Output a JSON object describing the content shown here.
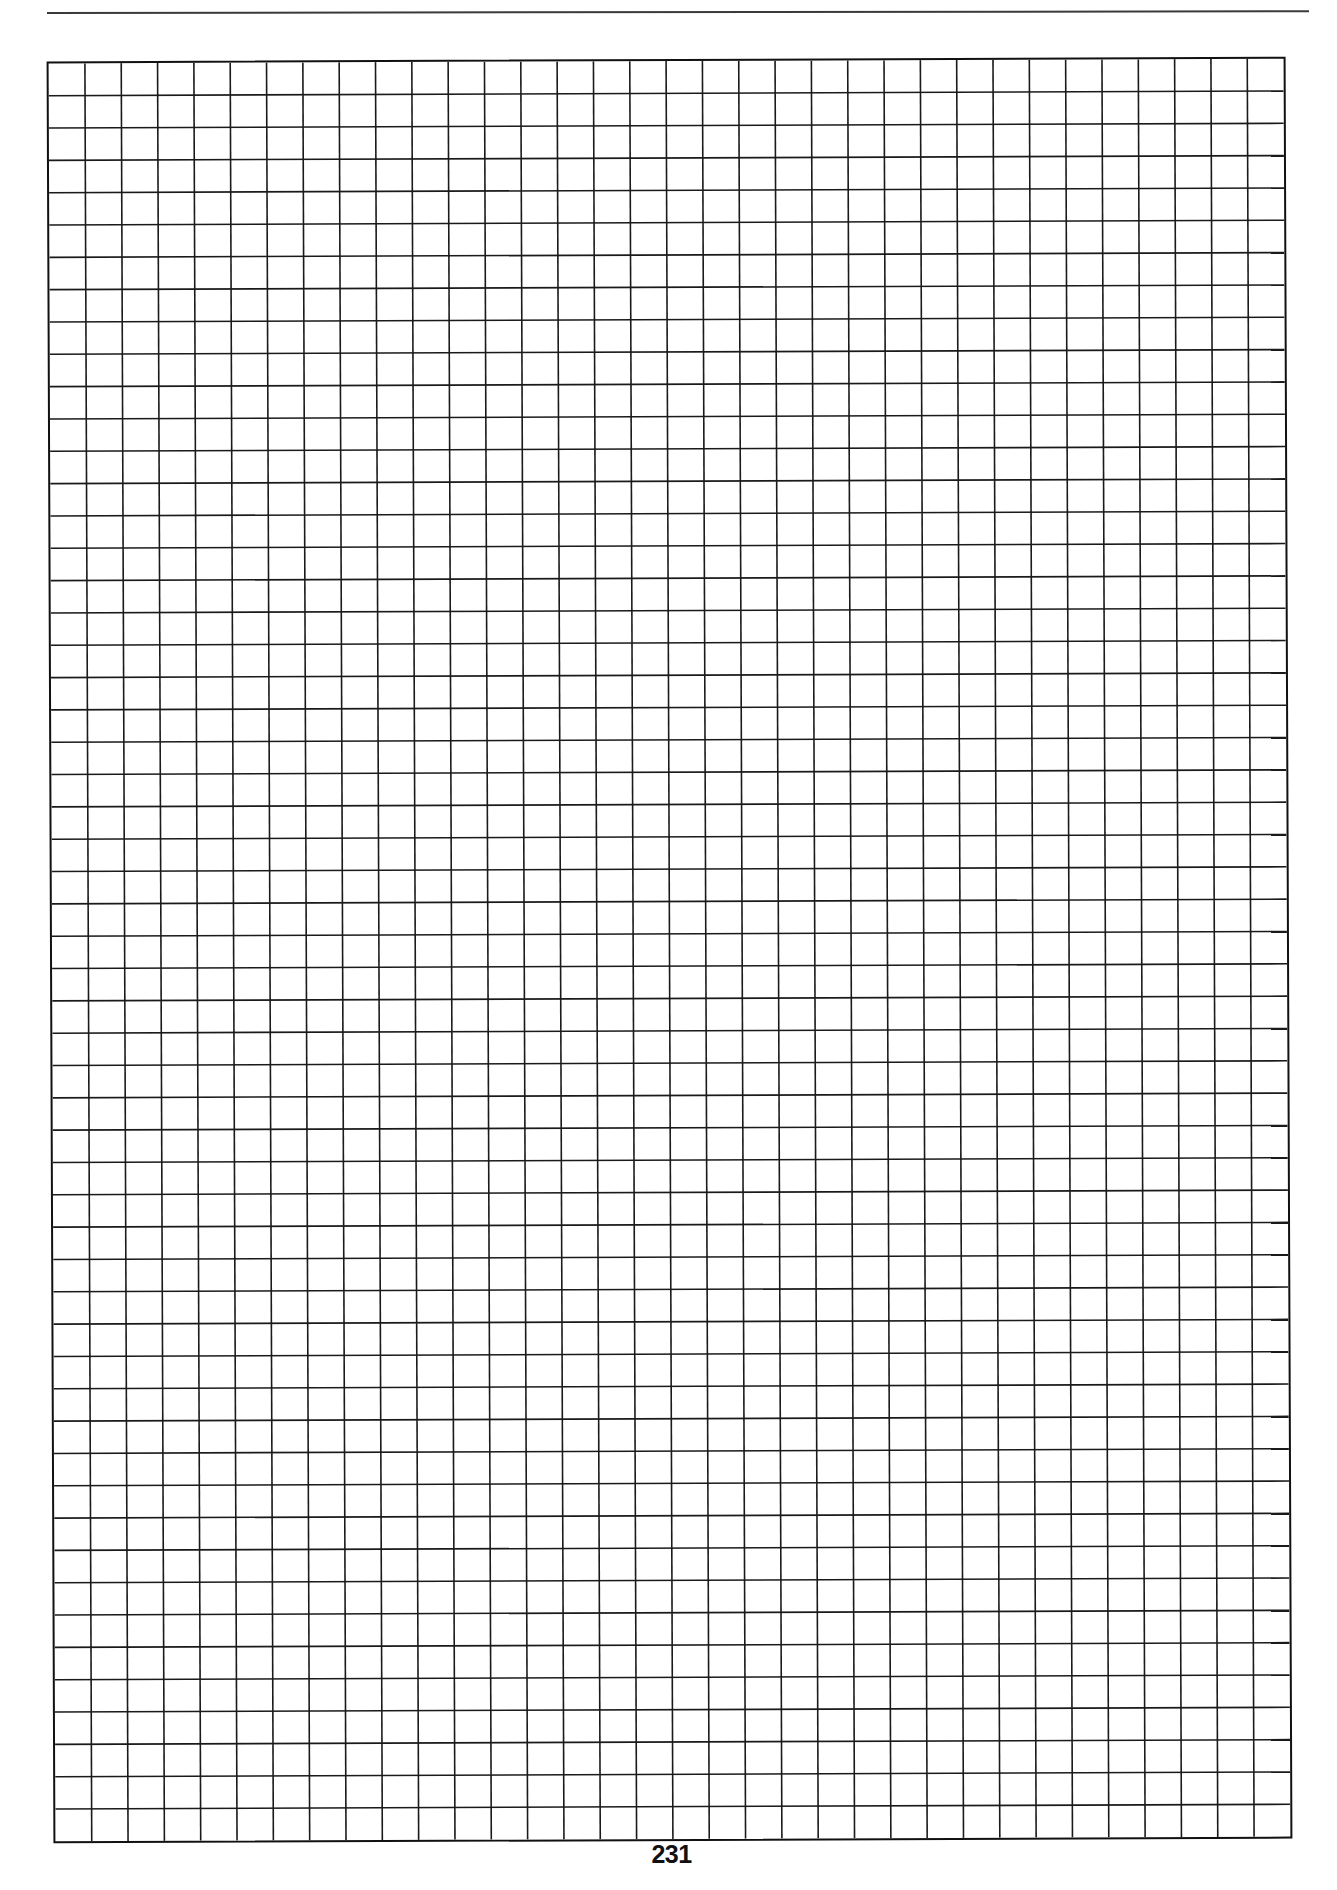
{
  "page": {
    "type": "graph-paper",
    "page_number": "231"
  },
  "grid": {
    "columns": 34,
    "rows": 55,
    "line_color": "#1a1a1a",
    "border_color": "#111111",
    "background": "#ffffff"
  },
  "header": {
    "rule_color": "#3a3a3a"
  }
}
